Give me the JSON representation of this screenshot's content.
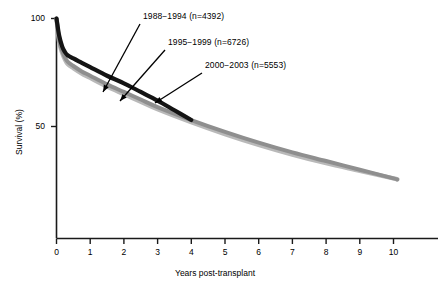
{
  "chart_data": {
    "type": "line",
    "title": "",
    "xlabel": "Years post-transplant",
    "ylabel": "Survival (%)",
    "xlim": [
      0,
      11.4
    ],
    "ylim": [
      0,
      100
    ],
    "xticks": [
      0,
      1,
      2,
      3,
      4,
      5,
      6,
      7,
      8,
      9,
      10
    ],
    "xticklabels": [
      "0",
      "1",
      "2",
      "3",
      "4",
      "5",
      "6",
      "7",
      "8",
      "9",
      "10"
    ],
    "yticks": [
      50,
      100
    ],
    "yticklabels": [
      "50",
      "100"
    ],
    "grid": false,
    "legend_position": "annotations-with-arrows",
    "series": [
      {
        "name": "1988−1994 (n=4392)",
        "label": "1988−1994 (n=4392)",
        "n": 4392,
        "color": "#141414",
        "x": [
          0,
          0.08,
          0.17,
          0.25,
          0.33,
          0.5,
          0.75,
          1,
          1.5,
          2,
          2.5,
          3,
          3.5,
          4
        ],
        "y": [
          100,
          92,
          87,
          84.5,
          83,
          81.5,
          79.5,
          77.5,
          73.5,
          70,
          66,
          62,
          57.5,
          53
        ]
      },
      {
        "name": "1995−1999 (n=6726)",
        "label": "1995−1999 (n=6726)",
        "n": 6726,
        "color": "#8f8f8f",
        "x": [
          0,
          0.08,
          0.17,
          0.25,
          0.33,
          0.5,
          0.75,
          1,
          1.5,
          2,
          2.5,
          3,
          4,
          5,
          6,
          7,
          8,
          9,
          10,
          10.1
        ],
        "y": [
          100,
          90,
          85,
          82,
          80,
          78,
          75.5,
          73.5,
          69.5,
          66,
          62.5,
          59,
          53,
          47.5,
          42.5,
          38,
          34,
          30,
          26,
          25.5
        ]
      },
      {
        "name": "2000−2003 (n=5553)",
        "label": "2000−2003 (n=5553)",
        "n": 5553,
        "color": "#b9b9b9",
        "x": [
          0,
          0.08,
          0.17,
          0.25,
          0.33,
          0.5,
          0.75,
          1,
          1.5,
          2,
          2.5,
          3,
          4,
          5,
          6,
          7,
          8,
          9,
          10,
          10.1
        ],
        "y": [
          100,
          89,
          84,
          81,
          79,
          77,
          74.5,
          72.5,
          68.5,
          65,
          61.5,
          58,
          52,
          46.5,
          41.5,
          37,
          33,
          29.5,
          26,
          25.5
        ]
      }
    ],
    "annotations": [
      {
        "text": "1988−1994 (n=4392)",
        "label_x": 143,
        "label_y": 15,
        "arrow_from_x": 140,
        "arrow_from_y": 24,
        "arrow_to_x": 103,
        "arrow_to_y": 92
      },
      {
        "text": "1995−1999 (n=6726)",
        "label_x": 168,
        "label_y": 41,
        "arrow_from_x": 165,
        "arrow_from_y": 50,
        "arrow_to_x": 120,
        "arrow_to_y": 101
      },
      {
        "text": "2000−2003 (n=5553)",
        "label_x": 205,
        "label_y": 64,
        "arrow_from_x": 202,
        "arrow_from_y": 73,
        "arrow_to_x": 155,
        "arrow_to_y": 103
      }
    ]
  },
  "axes": {
    "x_title": "Years post-transplant",
    "y_title": "Survival (%)",
    "x_tick_labels": [
      "0",
      "1",
      "2",
      "3",
      "4",
      "5",
      "6",
      "7",
      "8",
      "9",
      "10"
    ],
    "y_tick_labels": [
      "100",
      "50"
    ]
  },
  "colors": {
    "axis": "#1a1a1a",
    "series_1988": "#141414",
    "series_1995": "#8f8f8f",
    "series_2000": "#b9b9b9",
    "background": "#ffffff"
  }
}
